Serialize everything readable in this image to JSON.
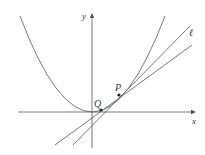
{
  "diagram": {
    "type": "parabola-tangent-secant",
    "axes": {
      "x_label": "x",
      "y_label": "y"
    },
    "curve": {
      "name": "parabola",
      "color": "#555555"
    },
    "points": [
      {
        "label": "Q",
        "x": 101,
        "y": 110
      },
      {
        "label": "P",
        "x": 119,
        "y": 95
      }
    ],
    "lines": [
      {
        "name": "tangent",
        "label": "ℓ"
      },
      {
        "name": "secant",
        "label": ""
      }
    ],
    "colors": {
      "stroke": "#555555",
      "text": "#333333",
      "background": "#ffffff"
    }
  }
}
